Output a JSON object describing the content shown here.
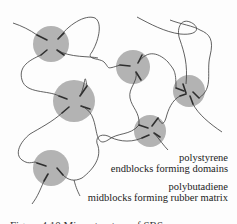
{
  "diagram": {
    "colors": {
      "background": "#fdfdfd",
      "domain_fill": "#b3b3b3",
      "chain_stroke": "#3a3a3a"
    },
    "labels": {
      "polystyrene_line1": "polystyrene",
      "polystyrene_line2": "endblocks forming domains",
      "polybutadiene_line1": "polybutadiene",
      "polybutadiene_line2": "midblocks forming rubber matrix"
    },
    "caption": "Figure 4.10 Microstructure of SBS",
    "domains": [
      {
        "id": "domain-1",
        "cx": 51,
        "cy": 44,
        "r": 18
      },
      {
        "id": "domain-2",
        "cx": 133,
        "cy": 67,
        "r": 17
      },
      {
        "id": "domain-3",
        "cx": 189,
        "cy": 91,
        "r": 16
      },
      {
        "id": "domain-4",
        "cx": 74,
        "cy": 101,
        "r": 21
      },
      {
        "id": "domain-5",
        "cx": 150,
        "cy": 131,
        "r": 16
      },
      {
        "id": "domain-6",
        "cx": 51,
        "cy": 168,
        "r": 18
      }
    ]
  }
}
